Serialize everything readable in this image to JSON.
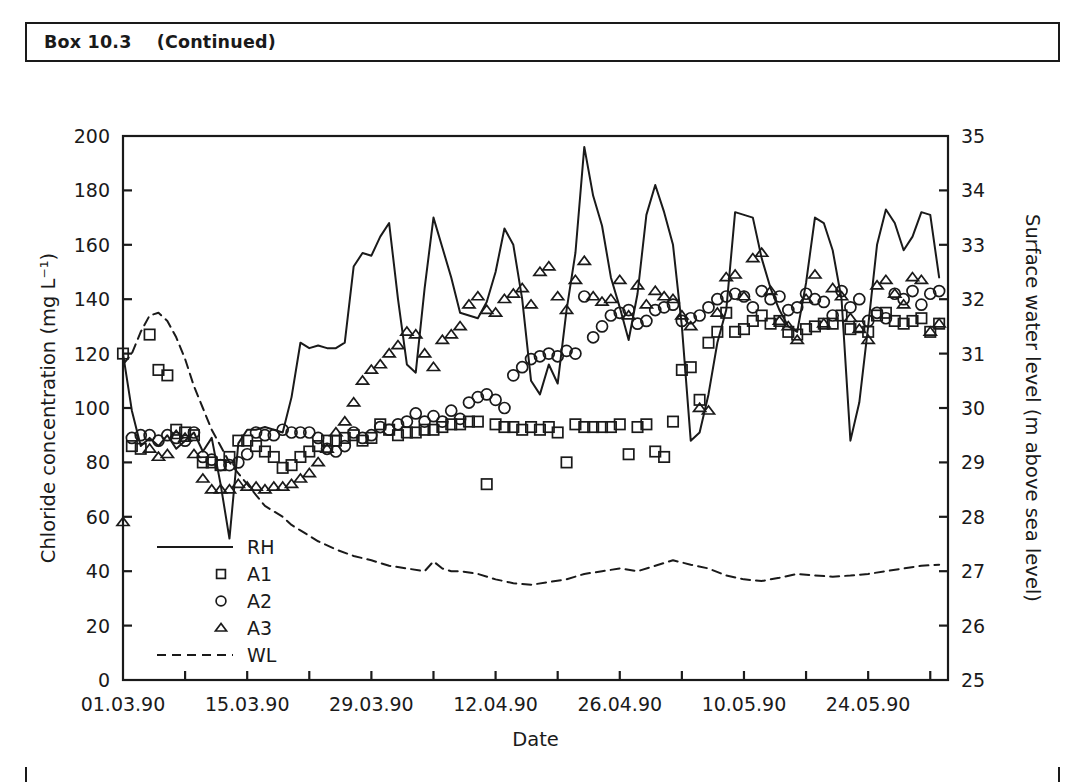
{
  "box": {
    "title": "Box 10.3    (Continued)",
    "label": "Box 10.3",
    "continued": "(Continued)"
  },
  "chart_data": {
    "type": "line",
    "title": "",
    "xlabel": "Date",
    "ylabel": "Chloride concentration (mg L⁻¹)",
    "y2label": "Surface water level (m above sea level)",
    "grid": false,
    "legend_position": "lower-left-inside",
    "xlim": [
      0,
      93
    ],
    "ylim": [
      0,
      200
    ],
    "y2lim": [
      25,
      35
    ],
    "yticks": [
      0,
      20,
      40,
      60,
      80,
      100,
      120,
      140,
      160,
      180,
      200
    ],
    "y2ticks": [
      25,
      26,
      27,
      28,
      29,
      30,
      31,
      32,
      33,
      34,
      35
    ],
    "xtick_labels": [
      "01.03.90",
      "15.03.90",
      "29.03.90",
      "12.04.90",
      "26.04.90",
      "10.05.90",
      "24.05.90"
    ],
    "xtick_days": [
      0,
      14,
      28,
      42,
      56,
      70,
      84
    ],
    "xminor_days": [
      7,
      21,
      35,
      49,
      63,
      77,
      91
    ],
    "series": [
      {
        "name": "RH",
        "marker": "none",
        "line": "solid",
        "axis": "left",
        "x": [
          0,
          1,
          2,
          3,
          4,
          5,
          6,
          7,
          8,
          9,
          10,
          11,
          12,
          13,
          14,
          15,
          16,
          17,
          18,
          19,
          20,
          21,
          22,
          23,
          24,
          25,
          26,
          27,
          28,
          29,
          30,
          31,
          32,
          33,
          34,
          35,
          36,
          37,
          38,
          39,
          40,
          41,
          42,
          43,
          44,
          45,
          46,
          47,
          48,
          49,
          50,
          51,
          52,
          53,
          54,
          55,
          56,
          57,
          58,
          59,
          60,
          61,
          62,
          63,
          64,
          65,
          66,
          67,
          68,
          69,
          70,
          71,
          72,
          73,
          74,
          75,
          76,
          77,
          78,
          79,
          80,
          81,
          82,
          83,
          84,
          85,
          86,
          87,
          88,
          89,
          90,
          91,
          92
        ],
        "y": [
          120,
          99,
          86,
          89,
          86,
          90,
          85,
          88,
          91,
          84,
          89,
          72,
          52,
          87,
          92,
          92,
          93,
          92,
          91,
          104,
          124,
          122,
          123,
          122,
          122,
          124,
          152,
          157,
          156,
          163,
          168,
          140,
          116,
          113,
          144,
          170,
          159,
          148,
          135,
          134,
          133,
          139,
          150,
          166,
          160,
          140,
          110,
          105,
          116,
          109,
          136,
          157,
          196,
          178,
          167,
          148,
          137,
          125,
          142,
          171,
          182,
          172,
          160,
          130,
          88,
          91,
          105,
          124,
          136,
          172,
          171,
          170,
          155,
          144,
          136,
          130,
          128,
          146,
          170,
          168,
          158,
          140,
          88,
          102,
          130,
          160,
          173,
          168,
          158,
          163,
          172,
          171,
          148
        ]
      },
      {
        "name": "A1",
        "marker": "square",
        "line": "none",
        "axis": "left",
        "x": [
          0,
          1,
          2,
          3,
          4,
          5,
          6,
          7,
          8,
          9,
          10,
          11,
          12,
          13,
          14,
          15,
          16,
          17,
          18,
          19,
          20,
          21,
          22,
          23,
          24,
          25,
          26,
          27,
          28,
          29,
          30,
          31,
          32,
          33,
          34,
          35,
          36,
          37,
          38,
          39,
          40,
          41,
          42,
          43,
          44,
          45,
          46,
          47,
          48,
          49,
          50,
          51,
          52,
          53,
          54,
          55,
          56,
          57,
          58,
          59,
          60,
          61,
          62,
          63,
          64,
          65,
          66,
          67,
          68,
          69,
          70,
          71,
          72,
          73,
          74,
          75,
          76,
          77,
          78,
          79,
          80,
          81,
          82,
          83,
          84,
          85,
          86,
          87,
          88,
          89,
          90,
          91,
          92
        ],
        "y": [
          120,
          86,
          85,
          127,
          114,
          112,
          92,
          91,
          90,
          80,
          80,
          79,
          82,
          88,
          88,
          86,
          84,
          82,
          78,
          79,
          82,
          84,
          86,
          88,
          88,
          89,
          90,
          88,
          89,
          94,
          92,
          90,
          91,
          91,
          92,
          92,
          93,
          94,
          94,
          95,
          95,
          72,
          94,
          93,
          93,
          92,
          93,
          92,
          93,
          91,
          80,
          94,
          93,
          93,
          93,
          93,
          94,
          83,
          93,
          94,
          84,
          82,
          95,
          114,
          115,
          103,
          124,
          128,
          135,
          128,
          129,
          132,
          134,
          131,
          132,
          128,
          127,
          129,
          130,
          131,
          131,
          134,
          129,
          130,
          128,
          134,
          135,
          132,
          131,
          132,
          133,
          128,
          131
        ]
      },
      {
        "name": "A2",
        "marker": "circle",
        "line": "none",
        "axis": "left",
        "x": [
          1,
          2,
          3,
          4,
          5,
          6,
          7,
          8,
          9,
          10,
          11,
          12,
          13,
          14,
          15,
          16,
          17,
          18,
          19,
          20,
          21,
          22,
          23,
          24,
          25,
          26,
          27,
          28,
          29,
          30,
          31,
          32,
          33,
          34,
          35,
          36,
          37,
          38,
          39,
          40,
          41,
          42,
          43,
          44,
          45,
          46,
          47,
          48,
          49,
          50,
          51,
          52,
          53,
          54,
          55,
          56,
          57,
          58,
          59,
          60,
          61,
          62,
          63,
          64,
          65,
          66,
          67,
          68,
          69,
          70,
          71,
          72,
          73,
          74,
          75,
          76,
          77,
          78,
          79,
          80,
          81,
          82,
          83,
          84,
          85,
          86,
          87,
          88,
          89,
          90,
          91,
          92
        ],
        "y": [
          89,
          90,
          90,
          88,
          90,
          89,
          88,
          91,
          82,
          81,
          79,
          79,
          80,
          83,
          91,
          90,
          90,
          92,
          91,
          91,
          91,
          89,
          85,
          84,
          86,
          91,
          89,
          90,
          93,
          92,
          94,
          95,
          98,
          95,
          97,
          95,
          99,
          96,
          102,
          104,
          105,
          103,
          100,
          112,
          115,
          118,
          119,
          120,
          119,
          121,
          120,
          141,
          126,
          130,
          134,
          135,
          136,
          131,
          132,
          136,
          137,
          138,
          132,
          133,
          134,
          137,
          140,
          141,
          142,
          141,
          137,
          143,
          140,
          141,
          136,
          137,
          142,
          140,
          139,
          134,
          143,
          137,
          140,
          132,
          135,
          133,
          142,
          140,
          143,
          138,
          142,
          143
        ]
      },
      {
        "name": "A3",
        "marker": "triangle",
        "line": "none",
        "axis": "left",
        "x": [
          0,
          3,
          4,
          5,
          6,
          7,
          8,
          9,
          10,
          11,
          12,
          13,
          14,
          15,
          16,
          17,
          18,
          19,
          20,
          21,
          22,
          23,
          24,
          25,
          26,
          27,
          28,
          29,
          30,
          31,
          32,
          33,
          34,
          35,
          36,
          37,
          38,
          39,
          40,
          41,
          42,
          43,
          44,
          45,
          46,
          47,
          48,
          49,
          50,
          51,
          52,
          53,
          54,
          55,
          56,
          57,
          58,
          59,
          60,
          61,
          62,
          63,
          64,
          65,
          66,
          67,
          68,
          69,
          70,
          71,
          72,
          73,
          74,
          75,
          76,
          77,
          78,
          79,
          80,
          81,
          82,
          83,
          84,
          85,
          86,
          87,
          88,
          89,
          90,
          91,
          92
        ],
        "y": [
          58,
          85,
          82,
          83,
          90,
          89,
          83,
          74,
          70,
          70,
          70,
          72,
          71,
          71,
          70,
          71,
          71,
          72,
          74,
          76,
          80,
          85,
          91,
          95,
          102,
          110,
          114,
          116,
          120,
          123,
          128,
          127,
          120,
          115,
          125,
          127,
          130,
          138,
          141,
          136,
          135,
          140,
          142,
          144,
          138,
          150,
          152,
          141,
          136,
          147,
          154,
          141,
          139,
          140,
          147,
          134,
          145,
          138,
          143,
          141,
          140,
          134,
          130,
          100,
          99,
          135,
          148,
          149,
          141,
          155,
          157,
          143,
          132,
          130,
          125,
          140,
          149,
          131,
          144,
          141,
          133,
          129,
          125,
          145,
          147,
          142,
          138,
          148,
          147,
          128,
          131
        ]
      },
      {
        "name": "WL",
        "marker": "none",
        "line": "dashed",
        "axis": "right",
        "x": [
          0,
          1,
          2,
          3,
          4,
          5,
          6,
          7,
          8,
          9,
          10,
          11,
          12,
          13,
          14,
          15,
          16,
          17,
          18,
          19,
          20,
          21,
          22,
          24,
          26,
          28,
          30,
          32,
          34,
          35,
          36,
          37,
          38,
          40,
          42,
          44,
          46,
          48,
          50,
          52,
          54,
          56,
          58,
          60,
          62,
          64,
          66,
          68,
          70,
          72,
          74,
          76,
          78,
          80,
          82,
          84,
          86,
          88,
          90,
          92
        ],
        "y": [
          30.8,
          31.0,
          31.4,
          31.7,
          31.75,
          31.6,
          31.3,
          30.9,
          30.4,
          30.0,
          29.6,
          29.3,
          29.0,
          28.8,
          28.6,
          28.4,
          28.2,
          28.1,
          28.0,
          27.85,
          27.75,
          27.65,
          27.55,
          27.4,
          27.28,
          27.2,
          27.1,
          27.05,
          27.0,
          27.18,
          27.05,
          27.0,
          27.0,
          26.95,
          26.85,
          26.78,
          26.75,
          26.8,
          26.85,
          26.95,
          27.0,
          27.05,
          27.0,
          27.1,
          27.2,
          27.12,
          27.05,
          26.92,
          26.85,
          26.82,
          26.88,
          26.95,
          26.92,
          26.9,
          26.92,
          26.95,
          27.0,
          27.05,
          27.1,
          27.12
        ]
      }
    ],
    "legend": [
      {
        "label": "RH",
        "type": "line-solid"
      },
      {
        "label": "A1",
        "type": "marker-square"
      },
      {
        "label": "A2",
        "type": "marker-circle"
      },
      {
        "label": "A3",
        "type": "marker-triangle"
      },
      {
        "label": "WL",
        "type": "line-dashed"
      }
    ]
  },
  "colors": {
    "ink": "#1a1a1a",
    "background": "#ffffff"
  }
}
